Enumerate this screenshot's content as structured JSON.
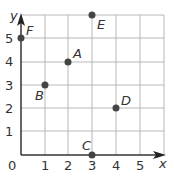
{
  "axes": {
    "x_label": "x",
    "y_label": "y",
    "origin_label": "0",
    "x_ticks": [
      "1",
      "2",
      "3",
      "4",
      "5"
    ],
    "y_ticks": [
      "1",
      "2",
      "3",
      "4",
      "5"
    ]
  },
  "points": [
    {
      "name": "A",
      "x": 2,
      "y": 4
    },
    {
      "name": "B",
      "x": 1,
      "y": 3
    },
    {
      "name": "C",
      "x": 3,
      "y": 0
    },
    {
      "name": "D",
      "x": 4,
      "y": 2
    },
    {
      "name": "E",
      "x": 3,
      "y": 6
    },
    {
      "name": "F",
      "x": 0,
      "y": 5
    }
  ],
  "colors": {
    "grid": "#b8b8b8",
    "axis": "#333333",
    "point": "#444444"
  }
}
